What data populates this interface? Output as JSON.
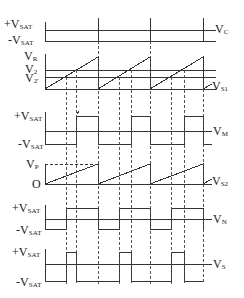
{
  "diagram": {
    "axis_x": 45,
    "period_px": 53,
    "cycle_starts": [
      45,
      98,
      150,
      203
    ],
    "crossings_v2prime": [
      66,
      119,
      171
    ],
    "crossings_v2": [
      76,
      131,
      184
    ],
    "line_color": "#333333",
    "dash_color": "#444444"
  },
  "labels": {
    "vc": {
      "left_top": "+V",
      "left_top_sub": "SAT",
      "left_bottom": "-V",
      "left_bottom_sub": "SAT",
      "right": "V",
      "right_sub": "C"
    },
    "ramp": {
      "vr": "V",
      "vr_sub": "R",
      "v2": "V",
      "v2_sub": "2",
      "v2p": "V",
      "v2p_sub": "2'",
      "right": "V",
      "right_sub": "S1"
    },
    "vm": {
      "left_top": "+V",
      "left_top_sub": "SAT",
      "left_bottom": "-V",
      "left_bottom_sub": "SAT",
      "right": "V",
      "right_sub": "M"
    },
    "vs2": {
      "vp": "V",
      "vp_sub": "P",
      "zero": "O",
      "right": "V",
      "right_sub": "S2"
    },
    "vn": {
      "left_top": "+V",
      "left_top_sub": "SAT",
      "left_bottom": "-V",
      "left_bottom_sub": "SAT",
      "right": "V",
      "right_sub": "N"
    },
    "vs": {
      "left_top": "+V",
      "left_top_sub": "SAT",
      "left_bottom": "-V",
      "left_bottom_sub": "SAT",
      "right": "V",
      "right_sub": "S"
    }
  }
}
